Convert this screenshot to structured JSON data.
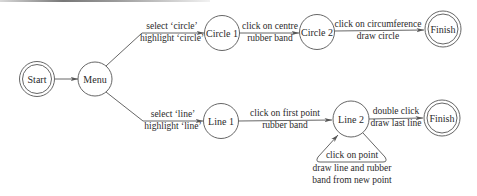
{
  "diagram": {
    "type": "state-transition",
    "colors": {
      "stroke": "#555555",
      "text": "#2a2a2a",
      "background": "#ffffff"
    },
    "nodes": {
      "start": {
        "label": "Start",
        "kind": "initial-double-circle"
      },
      "menu": {
        "label": "Menu",
        "kind": "state"
      },
      "circle1": {
        "label": "Circle 1",
        "kind": "state"
      },
      "circle2": {
        "label": "Circle 2",
        "kind": "state"
      },
      "finish_top": {
        "label": "Finish",
        "kind": "final-double-circle"
      },
      "line1": {
        "label": "Line 1",
        "kind": "state"
      },
      "line2": {
        "label": "Line 2",
        "kind": "state"
      },
      "finish_bottom": {
        "label": "Finish",
        "kind": "final-double-circle"
      }
    },
    "edges": {
      "start_menu": {
        "from": "Start",
        "to": "Menu",
        "event": "",
        "action": ""
      },
      "menu_circle1": {
        "from": "Menu",
        "to": "Circle 1",
        "event": "select ‘circle’",
        "action": "highlight ‘circle’"
      },
      "circle1_circle2": {
        "from": "Circle 1",
        "to": "Circle 2",
        "event": "click on centre",
        "action": "rubber band"
      },
      "circle2_finish": {
        "from": "Circle 2",
        "to": "Finish",
        "event": "click on circumference",
        "action": "draw circle"
      },
      "menu_line1": {
        "from": "Menu",
        "to": "Line 1",
        "event": "select ‘line’",
        "action": "highlight ‘line’"
      },
      "line1_line2": {
        "from": "Line 1",
        "to": "Line 2",
        "event": "click on first point",
        "action": "rubber band"
      },
      "line2_finish": {
        "from": "Line 2",
        "to": "Finish",
        "event": "double click",
        "action": "draw last line"
      },
      "line2_loop": {
        "from": "Line 2",
        "to": "Line 2",
        "event": "click on point",
        "action": "draw line and rubber",
        "action2": "band from new point"
      }
    }
  }
}
